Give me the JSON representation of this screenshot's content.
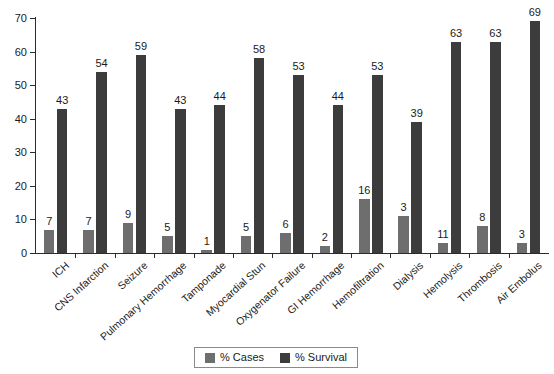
{
  "chart_data": {
    "type": "bar",
    "title": "",
    "subtitle": "",
    "xlabel": "",
    "ylabel": "",
    "ylim": [
      0,
      70
    ],
    "yticks": [
      0,
      10,
      20,
      30,
      40,
      50,
      60,
      70
    ],
    "grid": false,
    "legend_position": "bottom-center",
    "categories": [
      "ICH",
      "CNS Infarction",
      "Seizure",
      "Pulmonary Hemorrhage",
      "Tamponade",
      "Myocardial Stun",
      "Oxygenator Failure",
      "GI Hemorrhage",
      "Hemofiltration",
      "Dialysis",
      "Hemolysis",
      "Thrombosis",
      "Air Embolus"
    ],
    "series": [
      {
        "name": "% Cases",
        "color": "#6e6e6e",
        "values": [
          7,
          7,
          9,
          5,
          1,
          5,
          6,
          2,
          16,
          3,
          11,
          8,
          3
        ],
        "plotted_heights": [
          7,
          7,
          9,
          5,
          1,
          5,
          6,
          2,
          16,
          11,
          3,
          8,
          3
        ]
      },
      {
        "name": "% Survival",
        "color": "#3c3c3c",
        "values": [
          43,
          54,
          59,
          43,
          44,
          58,
          53,
          44,
          53,
          39,
          63,
          63,
          69
        ],
        "plotted_heights": [
          43,
          54,
          59,
          43,
          44,
          58,
          53,
          44,
          53,
          39,
          63,
          63,
          69
        ]
      }
    ]
  },
  "legend": {
    "items": [
      {
        "label": "% Cases",
        "color": "#6e6e6e"
      },
      {
        "label": "% Survival",
        "color": "#3c3c3c"
      }
    ]
  },
  "axis": {
    "y_tick_labels": [
      "0",
      "10",
      "20",
      "30",
      "40",
      "50",
      "60",
      "70"
    ]
  }
}
